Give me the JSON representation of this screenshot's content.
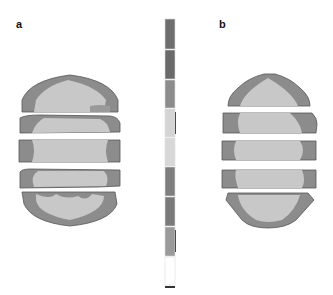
{
  "figure": {
    "panels": [
      {
        "label": "a",
        "slices": 5
      },
      {
        "label": "b",
        "slices": 5
      }
    ],
    "colorbar": {
      "segments": [
        "#6e6e6e",
        "#6a6a6a",
        "#8c8c8c",
        "#d4d4d4",
        "#d8d8d8",
        "#7e7e7e",
        "#7a7a7a",
        "#9a9a9a",
        "#ffffff"
      ],
      "side_ticks": [
        "#4a4a4a",
        "#4a4a4a"
      ]
    },
    "colors": {
      "outer": "#8a8a8a",
      "rim": "#9b9b9b",
      "inner": "#c8c8c8",
      "core": "#d6d6d6",
      "edge": "#555555"
    }
  }
}
